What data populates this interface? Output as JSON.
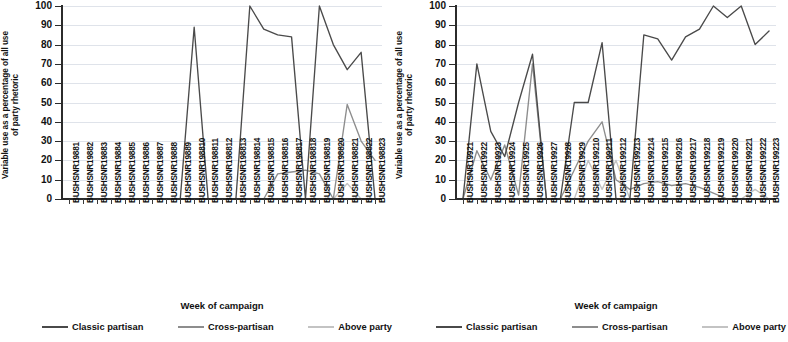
{
  "axes": {
    "ylabel_line1": "Variable use as a percentage of all use",
    "ylabel_line2": "of party rhetoric",
    "xlabel": "Week of campaign",
    "yticks": [
      "100",
      "90",
      "80",
      "70",
      "60",
      "50",
      "40",
      "30",
      "20",
      "10",
      "0"
    ]
  },
  "legend": {
    "items": [
      {
        "label": "Classic partisan",
        "color": "#4a4a4a"
      },
      {
        "label": "Cross-partisan",
        "color": "#8d8d8d"
      },
      {
        "label": "Above party",
        "color": "#c3c3c3"
      }
    ]
  },
  "colors": {
    "classic": "#4a4a4a",
    "cross": "#8d8d8d",
    "above": "#c3c3c3",
    "axis": "#2b2b2b",
    "grid": "#dfe3ea"
  },
  "chart_data": [
    {
      "type": "line",
      "panel": "left",
      "title": "",
      "xlabel": "Week of campaign",
      "ylabel": "Variable use as a percentage of all use of party rhetoric",
      "ylim": [
        0,
        100
      ],
      "grid": true,
      "legend_position": "bottom",
      "categories": [
        "BUSHSNR19881",
        "BUSHSNR19882",
        "BUSHSNR19883",
        "BUSHSNR19884",
        "BUSHSNR19885",
        "BUSHSNR19886",
        "BUSHSNR19887",
        "BUSHSNR19888",
        "BUSHSNR19889",
        "BUSHSNR198810",
        "BUSHSNR198811",
        "BUSHSNR198812",
        "BUSHSNR198813",
        "BUSHSNR198814",
        "BUSHSNR198815",
        "BUSHSNR198816",
        "BUSHSNR198817",
        "BUSHSNR198818",
        "BUSHSNR198819",
        "BUSHSNR198820",
        "BUSHSNR198821",
        "BUSHSNR198822",
        "BUSHSNR198823"
      ],
      "series": [
        {
          "name": "Classic partisan",
          "color": "#4a4a4a",
          "values": [
            null,
            null,
            null,
            null,
            null,
            null,
            null,
            null,
            0,
            89,
            0,
            null,
            0,
            100,
            88,
            85,
            84,
            0,
            100,
            80,
            67,
            76,
            0
          ]
        },
        {
          "name": "Cross-partisan",
          "color": "#8d8d8d",
          "values": [
            null,
            null,
            null,
            null,
            null,
            null,
            null,
            null,
            null,
            null,
            null,
            null,
            null,
            0,
            0,
            13,
            14,
            15,
            13,
            0,
            49,
            30,
            20
          ]
        },
        {
          "name": "Above party",
          "color": "#c3c3c3",
          "values": [
            null,
            null,
            null,
            null,
            null,
            null,
            null,
            null,
            null,
            null,
            null,
            null,
            null,
            null,
            null,
            null,
            null,
            null,
            0,
            0,
            8,
            0,
            0
          ]
        }
      ]
    },
    {
      "type": "line",
      "panel": "right",
      "title": "",
      "xlabel": "Week of campaign",
      "ylabel": "Variable use as a percentage of all use of party rhetoric",
      "ylim": [
        0,
        100
      ],
      "grid": true,
      "legend_position": "bottom",
      "categories": [
        "BUSHSNR19921",
        "BUSHSNR19922",
        "BUSHSNR19923",
        "BUSHSNR19924",
        "BUSHSNR19925",
        "BUSHSNR19926",
        "BUSHSNR19927",
        "BUSHSNR19928",
        "BUSHSNR19929",
        "BUSHSNR199210",
        "BUSHSNR199211",
        "BUSHSNR199212",
        "BUSHSNR199213",
        "BUSHSNR199214",
        "BUSHSNR199215",
        "BUSHSNR199216",
        "BUSHSNR199217",
        "BUSHSNR199218",
        "BUSHSNR199219",
        "BUSHSNR199220",
        "BUSHSNR199221",
        "BUSHSNR199222",
        "BUSHSNR199223"
      ],
      "series": [
        {
          "name": "Classic partisan",
          "color": "#4a4a4a",
          "values": [
            0,
            70,
            35,
            22,
            50,
            75,
            0,
            0,
            50,
            50,
            81,
            0,
            0,
            85,
            83,
            72,
            84,
            88,
            100,
            94,
            100,
            80,
            87
          ]
        },
        {
          "name": "Cross-partisan",
          "color": "#8d8d8d",
          "values": [
            0,
            25,
            10,
            28,
            2,
            70,
            0,
            0,
            15,
            30,
            40,
            10,
            5,
            8,
            9,
            7,
            8,
            6,
            3,
            0,
            0,
            0,
            0
          ]
        },
        {
          "name": "Above party",
          "color": "#c3c3c3",
          "values": [
            0,
            0,
            0,
            0,
            0,
            0,
            0,
            0,
            0,
            20,
            5,
            20,
            0,
            0,
            0,
            0,
            0,
            0,
            0,
            0,
            0,
            5,
            0
          ]
        }
      ]
    }
  ]
}
